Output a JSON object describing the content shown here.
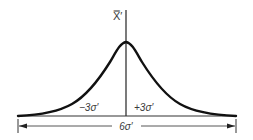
{
  "diagram": {
    "type": "normal-distribution-curve",
    "axis_label": "X̿′",
    "left_label": "−3σ′",
    "right_label": "+3σ′",
    "span_label": "6σ′",
    "colors": {
      "curve": "#111111",
      "lines": "#333333",
      "text": "#3a3a3a",
      "background": "#ffffff"
    }
  }
}
